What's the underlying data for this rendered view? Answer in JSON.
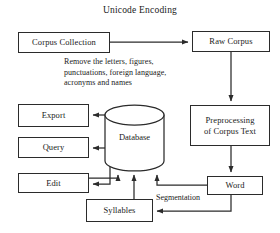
{
  "diagram": {
    "title": "Unicode Encoding",
    "nodes": {
      "corpus_collection": {
        "label": "Corpus Collection",
        "x": 18,
        "y": 32,
        "w": 92,
        "h": 21
      },
      "raw_corpus": {
        "label": "Raw Corpus",
        "x": 192,
        "y": 31,
        "w": 78,
        "h": 21
      },
      "preprocessing": {
        "label": "Preprocessing\nof Corpus Text",
        "line1": "Preprocessing",
        "line2": "of Corpus Text",
        "x": 190,
        "y": 105,
        "w": 80,
        "h": 41
      },
      "word": {
        "label": "Word",
        "x": 207,
        "y": 176,
        "w": 56,
        "h": 19
      },
      "syllables": {
        "label": "Syllables",
        "x": 86,
        "y": 199,
        "w": 67,
        "h": 23
      },
      "edit": {
        "label": "Edit",
        "x": 18,
        "y": 173,
        "w": 71,
        "h": 20
      },
      "query": {
        "label": "Query",
        "x": 18,
        "y": 137,
        "w": 71,
        "h": 21
      },
      "export": {
        "label": "Export",
        "x": 18,
        "y": 104,
        "w": 71,
        "h": 23
      },
      "database": {
        "label": "Database",
        "x": 105,
        "y": 105,
        "w": 59,
        "h": 66
      }
    },
    "edge_notes": [
      {
        "name": "remove-note",
        "line1": "Remove the letters, figures,",
        "line2": "punctuations, foreign language,",
        "line3": "acronyms and names",
        "x": 64,
        "y": 57
      }
    ],
    "edge_labels": [
      {
        "name": "segmentation-label",
        "text": "Segmentation",
        "x": 155,
        "y": 193
      }
    ],
    "connections": [
      {
        "from": "corpus_collection",
        "to": "raw_corpus",
        "type": "arrow-right"
      },
      {
        "from": "raw_corpus",
        "to": "preprocessing",
        "type": "arrow-down"
      },
      {
        "from": "preprocessing",
        "to": "word",
        "type": "arrow-down"
      },
      {
        "from": "word",
        "to": "syllables",
        "type": "arrow-left"
      },
      {
        "from": "word",
        "to": "database",
        "type": "arrow-up"
      },
      {
        "from": "syllables",
        "to": "database",
        "type": "arrow-up"
      },
      {
        "from": "edit",
        "to": "database",
        "type": "arrow-up"
      },
      {
        "from": "database",
        "to": "export",
        "type": "arrow-left"
      },
      {
        "from": "database",
        "to": "query",
        "type": "arrow-left"
      },
      {
        "from": "database",
        "to": "edit",
        "type": "arrow-left"
      }
    ],
    "colors": {
      "stroke": "#2b2b2b",
      "text": "#1a1a1a",
      "background": "#ffffff"
    }
  }
}
